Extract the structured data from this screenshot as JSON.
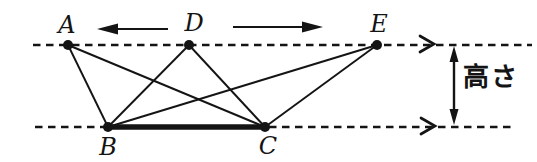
{
  "figure": {
    "background": "#ffffff",
    "ink": "#141414",
    "height_label": "高さ",
    "points": [
      {
        "name": "A",
        "x": 68,
        "y": 45,
        "label_x": 67,
        "label_y": 25
      },
      {
        "name": "D",
        "x": 189,
        "y": 45,
        "label_x": 194,
        "label_y": 23
      },
      {
        "name": "E",
        "x": 377,
        "y": 45,
        "label_x": 379,
        "label_y": 24
      },
      {
        "name": "B",
        "x": 108,
        "y": 127,
        "label_x": 108,
        "label_y": 147
      },
      {
        "name": "C",
        "x": 265,
        "y": 127,
        "label_x": 268,
        "label_y": 146
      }
    ],
    "edges": [
      [
        "A",
        "B"
      ],
      [
        "A",
        "C"
      ],
      [
        "D",
        "B"
      ],
      [
        "D",
        "C"
      ],
      [
        "E",
        "B"
      ],
      [
        "E",
        "C"
      ]
    ],
    "thick_edge": [
      "B",
      "C"
    ],
    "parallel_lines": {
      "top_y": 45,
      "top_x_start": 33,
      "top_x_end": 532,
      "bottom_y": 127,
      "bottom_x_start": 35,
      "bottom_x_end": 514
    },
    "line_end_chevrons": [
      {
        "x": 434,
        "y": 44
      },
      {
        "x": 435,
        "y": 126
      }
    ],
    "motion_arrows": [
      {
        "direction": "left",
        "tip_x": 97,
        "tail_x": 168,
        "y": 29
      },
      {
        "direction": "right",
        "tip_x": 323,
        "tail_x": 233,
        "y": 27
      }
    ],
    "height_arrow": {
      "x": 454,
      "y_top": 46,
      "y_bottom": 125
    }
  }
}
